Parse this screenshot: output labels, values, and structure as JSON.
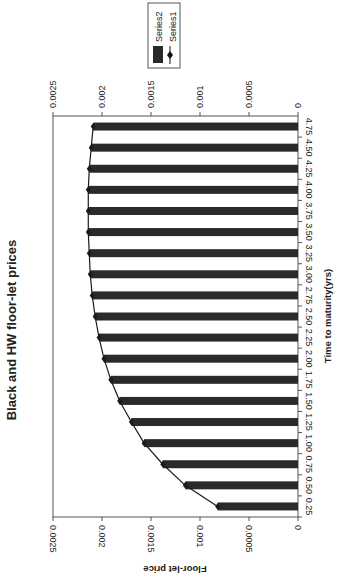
{
  "chart_data": {
    "type": "bar",
    "orientation": "rotated-90",
    "title": "Black and HW floor-let prices",
    "xlabel": "Time to maturity(yrs)",
    "ylabel": "Floor-let price",
    "ylim": [
      0,
      0.0025
    ],
    "yticks": [
      "0",
      "0.0005",
      "0.001",
      "0.0015",
      "0.002",
      "0.0025"
    ],
    "grid": false,
    "legend_position": "top-right",
    "categories": [
      "0.25",
      "0.50",
      "0.75",
      "1.00",
      "1.25",
      "1.50",
      "1.75",
      "2.00",
      "2.25",
      "2.50",
      "2.75",
      "3.00",
      "3.25",
      "3.50",
      "3.75",
      "4.00",
      "4.25",
      "4.50",
      "4.75"
    ],
    "series": [
      {
        "name": "Series2",
        "type": "bar",
        "color": "#2a2a2a",
        "values": [
          0.00082,
          0.00115,
          0.00138,
          0.00157,
          0.0017,
          0.00182,
          0.00191,
          0.00198,
          0.00203,
          0.00207,
          0.0021,
          0.00212,
          0.00213,
          0.00214,
          0.00214,
          0.00214,
          0.00213,
          0.00211,
          0.00209
        ]
      },
      {
        "name": "Series1",
        "type": "line",
        "marker": "diamond",
        "color": "#1a1a1a",
        "values": [
          0.00082,
          0.00115,
          0.00138,
          0.00157,
          0.0017,
          0.00182,
          0.00191,
          0.00198,
          0.00203,
          0.00207,
          0.0021,
          0.00212,
          0.00213,
          0.00214,
          0.00214,
          0.00214,
          0.00213,
          0.00211,
          0.00209
        ]
      }
    ]
  },
  "legend": {
    "items": [
      {
        "label": "Series2",
        "symbol": "bar-swatch"
      },
      {
        "label": "Series1",
        "symbol": "line-diamond"
      }
    ]
  }
}
